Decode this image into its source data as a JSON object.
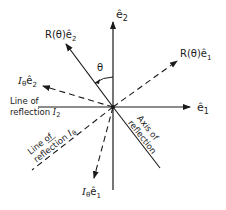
{
  "diagram": {
    "origin": [
      113,
      107
    ],
    "colors": {
      "ink": "#1a1a1a",
      "background": "#ffffff"
    },
    "labels": {
      "e2_hat": "ê",
      "e2_sub": "2",
      "e1_hat": "ê",
      "e1_sub": "1",
      "r_e2_prefix": "R(θ)ê",
      "r_e2_sub": "2",
      "r_e1_prefix": "R(θ)ê",
      "r_e1_sub": "1",
      "i_e2_I": "I",
      "i_e2_theta": "θ",
      "i_e2_vec": "ê",
      "i_e2_sub": "2",
      "i_e1_I": "I",
      "i_e1_theta": "θ",
      "i_e1_vec": "ê",
      "i_e1_sub": "1",
      "theta": "θ",
      "line_i2_line1": "Line of",
      "line_i2_line2": "reflection ",
      "line_i2_I": "I",
      "line_i2_sub": "2",
      "line_itheta_line1": "Line of",
      "line_itheta_line2": "reflection ",
      "line_itheta_I": "I",
      "line_itheta_sub": "θ",
      "axis_line1": "Axis of",
      "axis_line2": "reflection"
    }
  }
}
